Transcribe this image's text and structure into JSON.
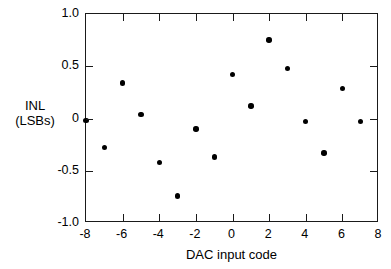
{
  "chart_data": {
    "type": "scatter",
    "title": "",
    "xlabel": "DAC input code",
    "ylabel": "INL (LSBs)",
    "ylabel_line1": "INL",
    "ylabel_line2": "(LSBs)",
    "xlim": [
      -8,
      8
    ],
    "ylim": [
      -1.0,
      1.0
    ],
    "xticks": [
      -8,
      -6,
      -4,
      -2,
      0,
      2,
      4,
      6,
      8
    ],
    "xticklabels": [
      "-8",
      "-6",
      "-4",
      "-2",
      "0",
      "2",
      "4",
      "6",
      "8"
    ],
    "yticks": [
      -1.0,
      -0.5,
      0,
      0.5,
      1.0
    ],
    "yticklabels": [
      "-1.0",
      "-0.5",
      "0",
      "0.5",
      "1.0"
    ],
    "grid": false,
    "legend": null,
    "marker": "filled-circle",
    "marker_color": "#000000",
    "x": [
      -8,
      -7,
      -6,
      -5,
      -4,
      -3,
      -2,
      -1,
      0,
      1,
      2,
      3,
      4,
      5,
      6,
      7
    ],
    "y": [
      -0.02,
      -0.28,
      0.34,
      0.04,
      -0.42,
      -0.74,
      -0.1,
      -0.37,
      0.42,
      0.12,
      0.75,
      0.48,
      -0.03,
      -0.33,
      0.29,
      -0.03
    ],
    "points": [
      {
        "x": -8,
        "y": -0.02
      },
      {
        "x": -7,
        "y": -0.28
      },
      {
        "x": -6,
        "y": 0.34
      },
      {
        "x": -5,
        "y": 0.04
      },
      {
        "x": -4,
        "y": -0.42
      },
      {
        "x": -3,
        "y": -0.74
      },
      {
        "x": -2,
        "y": -0.1
      },
      {
        "x": -1,
        "y": -0.37
      },
      {
        "x": 0,
        "y": 0.42
      },
      {
        "x": 1,
        "y": 0.12
      },
      {
        "x": 2,
        "y": 0.75
      },
      {
        "x": 3,
        "y": 0.48
      },
      {
        "x": 4,
        "y": -0.03
      },
      {
        "x": 5,
        "y": -0.33
      },
      {
        "x": 6,
        "y": 0.29
      },
      {
        "x": 7,
        "y": -0.03
      }
    ]
  }
}
